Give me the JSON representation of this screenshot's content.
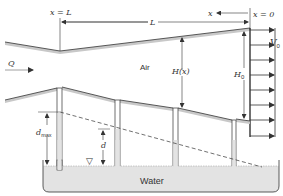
{
  "diagram": {
    "labels": {
      "x_eq_L": "x = L",
      "x_eq_0": "x = 0",
      "L": "L",
      "x_axis": "x",
      "V0_main": "V",
      "V0_sub": "0",
      "Q": "Q",
      "air": "Air",
      "Hx": "H(x)",
      "H0_main": "H",
      "H0_sub": "0",
      "dmax_main": "d",
      "dmax_sub": "max",
      "d": "d",
      "water": "Water",
      "free_surface_symbol": "▽"
    },
    "colors": {
      "line": "#333333",
      "wall_fill": "#c8c8c8",
      "water_fill": "#e3e3e3",
      "dash": "#333333"
    },
    "velocity_arrows_y": [
      31,
      46,
      61,
      76,
      91,
      106,
      121,
      136
    ]
  }
}
